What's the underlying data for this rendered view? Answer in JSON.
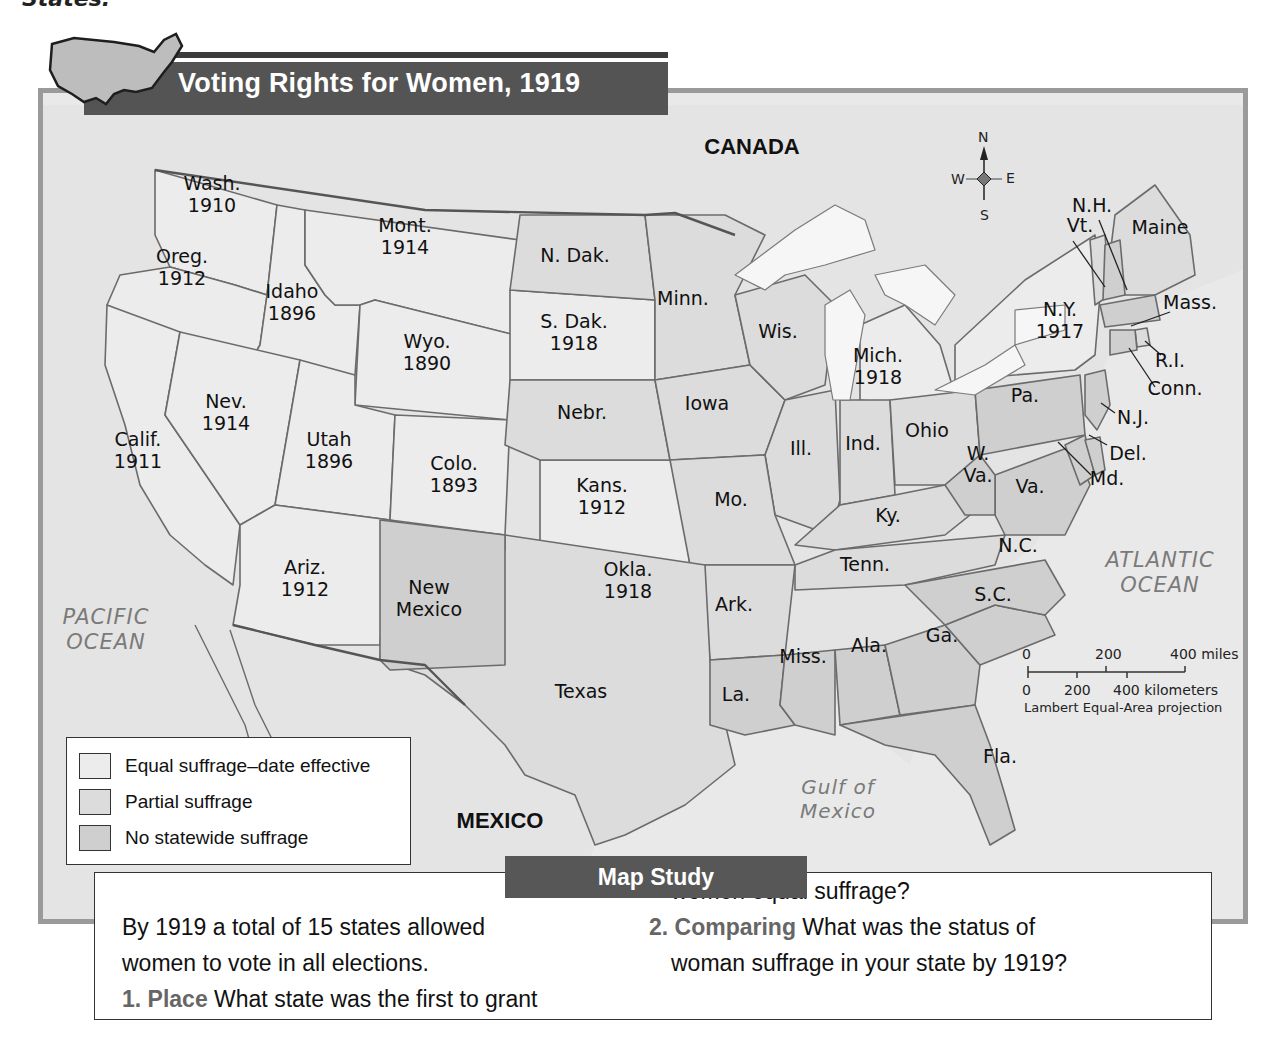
{
  "page_header_fragment": "States.",
  "map": {
    "title": "Voting Rights for Women, 1919",
    "countries": {
      "north": "CANADA",
      "south": "MEXICO"
    },
    "water_bodies": {
      "pacific": [
        "PACIFIC",
        "OCEAN"
      ],
      "atlantic": [
        "ATLANTIC",
        "OCEAN"
      ],
      "gulf": [
        "Gulf of",
        "Mexico"
      ]
    },
    "compass": {
      "n": "N",
      "s": "S",
      "e": "E",
      "w": "W"
    },
    "scale": {
      "miles": [
        "0",
        "200",
        "400 miles"
      ],
      "kilometers": [
        "0",
        "200",
        "400 kilometers"
      ],
      "projection": "Lambert Equal-Area projection"
    },
    "legend": [
      {
        "label": "Equal suffrage–date effective",
        "color": "#ececec"
      },
      {
        "label": "Partial suffrage",
        "color": "#dcdcdc"
      },
      {
        "label": "No statewide suffrage",
        "color": "#cfcfcf"
      }
    ],
    "states": [
      {
        "name": "Wash.",
        "year": "1910",
        "status": "equal"
      },
      {
        "name": "Oreg.",
        "year": "1912",
        "status": "equal"
      },
      {
        "name": "Calif.",
        "year": "1911",
        "status": "equal"
      },
      {
        "name": "Idaho",
        "year": "1896",
        "status": "equal"
      },
      {
        "name": "Nev.",
        "year": "1914",
        "status": "equal"
      },
      {
        "name": "Mont.",
        "year": "1914",
        "status": "equal"
      },
      {
        "name": "Wyo.",
        "year": "1890",
        "status": "equal"
      },
      {
        "name": "Utah",
        "year": "1896",
        "status": "equal"
      },
      {
        "name": "Colo.",
        "year": "1893",
        "status": "equal"
      },
      {
        "name": "Ariz.",
        "year": "1912",
        "status": "equal"
      },
      {
        "name": "S. Dak.",
        "year": "1918",
        "status": "equal"
      },
      {
        "name": "Kans.",
        "year": "1912",
        "status": "equal"
      },
      {
        "name": "Okla.",
        "year": "1918",
        "status": "equal"
      },
      {
        "name": "Mich.",
        "year": "1918",
        "status": "equal"
      },
      {
        "name": "N.Y.",
        "year": "1917",
        "status": "equal"
      },
      {
        "name": "N. Dak.",
        "year": "",
        "status": "partial"
      },
      {
        "name": "Nebr.",
        "year": "",
        "status": "partial"
      },
      {
        "name": "Minn.",
        "year": "",
        "status": "partial"
      },
      {
        "name": "Iowa",
        "year": "",
        "status": "partial"
      },
      {
        "name": "Wis.",
        "year": "",
        "status": "partial"
      },
      {
        "name": "Ill.",
        "year": "",
        "status": "partial"
      },
      {
        "name": "Ind.",
        "year": "",
        "status": "partial"
      },
      {
        "name": "Ohio",
        "year": "",
        "status": "partial"
      },
      {
        "name": "Mo.",
        "year": "",
        "status": "partial"
      },
      {
        "name": "Ky.",
        "year": "",
        "status": "partial"
      },
      {
        "name": "Tenn.",
        "year": "",
        "status": "partial"
      },
      {
        "name": "Ark.",
        "year": "",
        "status": "partial"
      },
      {
        "name": "Texas",
        "year": "",
        "status": "partial"
      },
      {
        "name": "Vt.",
        "year": "",
        "status": "partial"
      },
      {
        "name": "Maine",
        "year": "",
        "status": "partial"
      },
      {
        "name": "R.I.",
        "year": "",
        "status": "partial"
      },
      {
        "name": "New Mexico",
        "year": "",
        "status": "none"
      },
      {
        "name": "La.",
        "year": "",
        "status": "none"
      },
      {
        "name": "Miss.",
        "year": "",
        "status": "none"
      },
      {
        "name": "Ala.",
        "year": "",
        "status": "none"
      },
      {
        "name": "Ga.",
        "year": "",
        "status": "none"
      },
      {
        "name": "Fla.",
        "year": "",
        "status": "none"
      },
      {
        "name": "S.C.",
        "year": "",
        "status": "none"
      },
      {
        "name": "N.C.",
        "year": "",
        "status": "none"
      },
      {
        "name": "Va.",
        "year": "",
        "status": "none"
      },
      {
        "name": "W. Va.",
        "year": "",
        "status": "none"
      },
      {
        "name": "Md.",
        "year": "",
        "status": "none"
      },
      {
        "name": "Del.",
        "year": "",
        "status": "none"
      },
      {
        "name": "Pa.",
        "year": "",
        "status": "none"
      },
      {
        "name": "N.J.",
        "year": "",
        "status": "none"
      },
      {
        "name": "Conn.",
        "year": "",
        "status": "none"
      },
      {
        "name": "Mass.",
        "year": "",
        "status": "none"
      },
      {
        "name": "N.H.",
        "year": "",
        "status": "none"
      }
    ]
  },
  "map_study": {
    "title": "Map Study",
    "intro": [
      "By 1919 a total of 15 states allowed",
      "women to vote in all elections."
    ],
    "questions": [
      {
        "number": "1.",
        "skill": "Place",
        "text_lines": [
          "What state was the first to grant",
          "women equal suffrage?"
        ]
      },
      {
        "number": "2.",
        "skill": "Comparing",
        "text_lines": [
          "What was the status of",
          "woman suffrage in your state by 1919?"
        ]
      }
    ]
  }
}
